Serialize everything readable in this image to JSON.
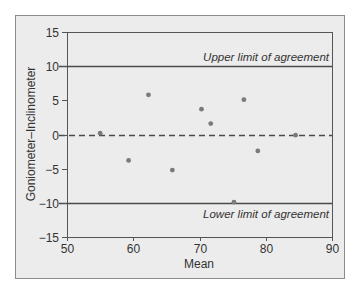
{
  "chart_data": {
    "type": "scatter",
    "title": "",
    "xlabel": "Mean",
    "ylabel": "Goniometer–Inclinometer",
    "xlim": [
      50,
      90
    ],
    "ylim": [
      -15,
      15
    ],
    "xticks": [
      50,
      60,
      70,
      80,
      90
    ],
    "yticks": [
      15,
      10,
      5,
      0,
      -5,
      -10,
      -15
    ],
    "grid": false,
    "legend": null,
    "points": [
      {
        "x": 55.0,
        "y": 0.2
      },
      {
        "x": 59.3,
        "y": -3.8
      },
      {
        "x": 62.3,
        "y": 5.8
      },
      {
        "x": 65.9,
        "y": -5.2
      },
      {
        "x": 70.3,
        "y": 3.7
      },
      {
        "x": 71.7,
        "y": 1.6
      },
      {
        "x": 75.2,
        "y": -9.9
      },
      {
        "x": 76.7,
        "y": 5.1
      },
      {
        "x": 78.8,
        "y": -2.4
      },
      {
        "x": 84.5,
        "y": -0.1
      }
    ],
    "reference_lines": [
      {
        "name": "Upper limit of agreement",
        "y": 10,
        "style": "solid",
        "label": "Upper limit of agreement"
      },
      {
        "name": "Mean difference",
        "y": 0,
        "style": "dashed",
        "label": ""
      },
      {
        "name": "Lower limit of agreement",
        "y": -10,
        "style": "solid",
        "label": "Lower limit of agreement"
      }
    ],
    "colors": {
      "frame_fill": "#ececec",
      "frame_border": "#8c8c8c",
      "axis": "#555555",
      "reference_line": "#4a4a4a",
      "point": "#7a7a7a",
      "text": "#333333"
    }
  }
}
